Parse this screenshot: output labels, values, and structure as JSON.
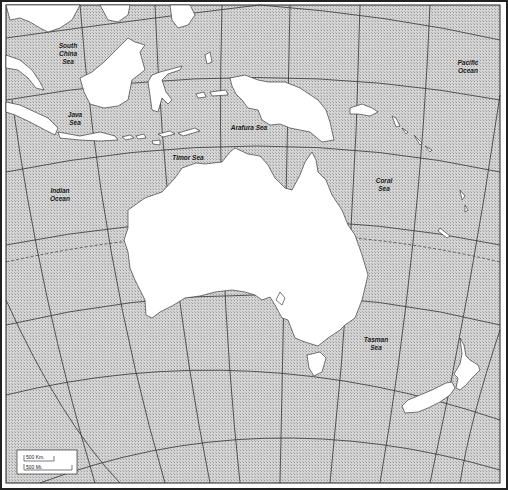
{
  "map": {
    "title": "Australia and Oceania outline map",
    "labels": {
      "south_china_sea": [
        "South",
        "China",
        "Sea"
      ],
      "java_sea": [
        "Java",
        "Sea"
      ],
      "arafura_sea": "Arafura Sea",
      "timor_sea": "Timor Sea",
      "indian_ocean": [
        "Indian",
        "Ocean"
      ],
      "coral_sea": [
        "Coral",
        "Sea"
      ],
      "pacific_ocean": [
        "Pacific",
        "Ocean"
      ],
      "tasman_sea": [
        "Tasman",
        "Sea"
      ]
    },
    "scale_bar": {
      "km_label": "500 Km.",
      "mi_label": "500 Mi."
    },
    "colors": {
      "water": "#c8c8c8",
      "land": "#ffffff",
      "graticule": "#333333",
      "border": "#222222"
    }
  }
}
